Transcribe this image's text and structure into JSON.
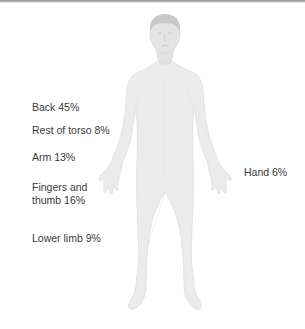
{
  "diagram": {
    "colors": {
      "body_fill": "#ebebeb",
      "body_outline": "#dcdcdc",
      "head_fill": "#d4d4d4",
      "label_text": "#3a3a3a",
      "top_bar": "#8a8a8a"
    },
    "labels": [
      {
        "id": "back",
        "text": "Back 45%",
        "region": "Back",
        "percent": 45
      },
      {
        "id": "rest-of-torso",
        "text": "Rest of torso 8%",
        "region": "Rest of torso",
        "percent": 8
      },
      {
        "id": "arm",
        "text": "Arm 13%",
        "region": "Arm",
        "percent": 13
      },
      {
        "id": "fingers-thumb-line1",
        "text": "Fingers and",
        "region": "Fingers and thumb",
        "percent": 16
      },
      {
        "id": "fingers-thumb-line2",
        "text": "thumb 16%"
      },
      {
        "id": "lower-limb",
        "text": "Lower limb 9%",
        "region": "Lower limb",
        "percent": 9
      },
      {
        "id": "hand",
        "text": "Hand 6%",
        "region": "Hand",
        "percent": 6
      }
    ]
  }
}
